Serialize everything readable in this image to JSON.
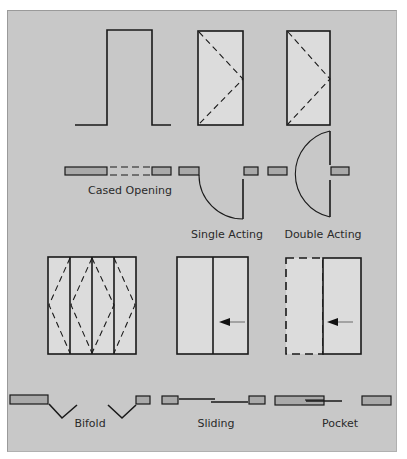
{
  "diagram": {
    "colors": {
      "background": "#c8c8c8",
      "panel_fill": "#dcdcdc",
      "wall_fill": "#a8a8a8",
      "line": "#1a1a1a"
    },
    "door_types": [
      {
        "id": "cased-opening",
        "label": "Cased Opening"
      },
      {
        "id": "single-acting",
        "label": "Single Acting"
      },
      {
        "id": "double-acting",
        "label": "Double Acting"
      },
      {
        "id": "bifold",
        "label": "Bifold"
      },
      {
        "id": "sliding",
        "label": "Sliding"
      },
      {
        "id": "pocket",
        "label": "Pocket"
      }
    ]
  }
}
